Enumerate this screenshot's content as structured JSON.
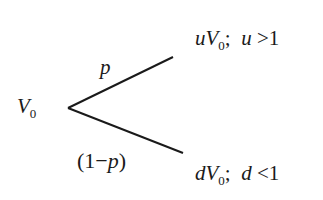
{
  "diagram": {
    "type": "binomial-tree",
    "root": {
      "var": "V",
      "sub": "0"
    },
    "branches": [
      {
        "probability": "p",
        "outcome": {
          "coef": "u",
          "var": "V",
          "sub": "0",
          "sep": ";",
          "cond_var": "u",
          "cond_op": ">",
          "cond_val": "1"
        }
      },
      {
        "probability_open": "(",
        "probability_num": "1",
        "probability_op": "−",
        "probability_var": "p",
        "probability_close": ")",
        "outcome": {
          "coef": "d",
          "var": "V",
          "sub": "0",
          "sep": ";",
          "cond_var": "d",
          "cond_op": "<",
          "cond_val": "1"
        }
      }
    ],
    "colors": {
      "line": "#1a1a1a",
      "text": "#1a1a1a",
      "background": "#ffffff"
    }
  }
}
